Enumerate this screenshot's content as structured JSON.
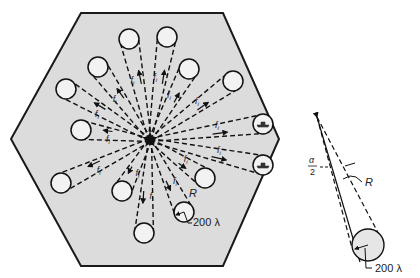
{
  "figure": {
    "hexagon": {
      "points": [
        [
          81,
          13
        ],
        [
          223,
          13
        ],
        [
          279,
          139
        ],
        [
          223,
          266
        ],
        [
          81,
          266
        ],
        [
          11,
          139
        ]
      ],
      "fill": "#dcdcdc",
      "stroke": "#1a1a1a"
    },
    "center": [
      150,
      140
    ],
    "beam_label": "f",
    "beam_label_sub": "i",
    "targets": [
      {
        "x": 129,
        "y": 39,
        "ship": false
      },
      {
        "x": 167,
        "y": 37,
        "ship": false
      },
      {
        "x": 189,
        "y": 69,
        "ship": false
      },
      {
        "x": 233,
        "y": 81,
        "ship": false
      },
      {
        "x": 263,
        "y": 124,
        "ship": true
      },
      {
        "x": 263,
        "y": 165,
        "ship": true
      },
      {
        "x": 205,
        "y": 178,
        "ship": false
      },
      {
        "x": 184,
        "y": 212,
        "ship": false
      },
      {
        "x": 144,
        "y": 233,
        "ship": false
      },
      {
        "x": 122,
        "y": 191,
        "ship": false
      },
      {
        "x": 61,
        "y": 183,
        "ship": false
      },
      {
        "x": 81,
        "y": 130,
        "ship": false
      },
      {
        "x": 66,
        "y": 89,
        "ship": false
      },
      {
        "x": 98,
        "y": 67,
        "ship": false
      }
    ],
    "labels": {
      "range": "R",
      "alpha": "α",
      "half": "2",
      "spot_size": "200 λ",
      "spot_size_detail": "200 λ"
    },
    "detail": {
      "apex": [
        317,
        117
      ],
      "circle": [
        368,
        245
      ],
      "radius": 16
    }
  }
}
